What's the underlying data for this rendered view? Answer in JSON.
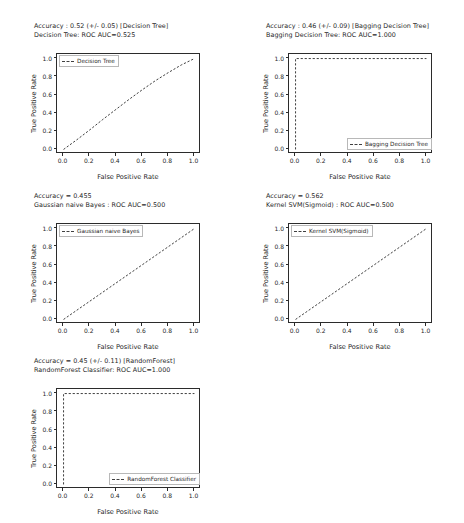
{
  "figure": {
    "background": "#ffffff",
    "line_color": "#404040",
    "line_style": "dashed",
    "axis_color": "#2b2b2b"
  },
  "chart_data": [
    {
      "type": "line",
      "title": "Accuracy : 0.52 (+/- 0.05) [Decision Tree]",
      "subtitle": "Decision Tree: ROC AUC=0.525",
      "xlabel": "False Positive Rate",
      "ylabel": "True Positive Rate",
      "xlim": [
        -0.05,
        1.05
      ],
      "ylim": [
        -0.05,
        1.05
      ],
      "xticks": [
        "0.0",
        "0.2",
        "0.4",
        "0.6",
        "0.8",
        "1.0"
      ],
      "yticks": [
        "0.0",
        "0.2",
        "0.4",
        "0.6",
        "0.8",
        "1.0"
      ],
      "grid": false,
      "legend_position": "upper left",
      "series": [
        {
          "name": "Decision Tree",
          "x": [
            0.0,
            0.1,
            0.2,
            0.3,
            0.4,
            0.5,
            0.6,
            0.7,
            0.8,
            0.9,
            1.0
          ],
          "values": [
            0.0,
            0.105,
            0.215,
            0.33,
            0.44,
            0.55,
            0.655,
            0.755,
            0.845,
            0.93,
            1.0
          ]
        }
      ]
    },
    {
      "type": "line",
      "title": "Accuracy : 0.46 (+/- 0.09) [Bagging Decision Tree]",
      "subtitle": "Bagging Decision Tree: ROC AUC=1.000",
      "xlabel": "False Positive Rate",
      "ylabel": "True Positive Rate",
      "xlim": [
        -0.05,
        1.05
      ],
      "ylim": [
        -0.05,
        1.05
      ],
      "xticks": [
        "0.0",
        "0.2",
        "0.4",
        "0.6",
        "0.8",
        "1.0"
      ],
      "yticks": [
        "0.0",
        "0.2",
        "0.4",
        "0.6",
        "0.8",
        "1.0"
      ],
      "grid": false,
      "legend_position": "lower right",
      "series": [
        {
          "name": "Bagging Decision Tree",
          "x": [
            0.0,
            0.0,
            1.0
          ],
          "values": [
            0.0,
            1.0,
            1.0
          ]
        }
      ]
    },
    {
      "type": "line",
      "title": "Accuracy = 0.455",
      "subtitle": "Gaussian naive Bayes : ROC AUC=0.500",
      "xlabel": "False Positive Rate",
      "ylabel": "True Positive Rate",
      "xlim": [
        -0.05,
        1.05
      ],
      "ylim": [
        -0.05,
        1.05
      ],
      "xticks": [
        "0.0",
        "0.2",
        "0.4",
        "0.6",
        "0.8",
        "1.0"
      ],
      "yticks": [
        "0.0",
        "0.2",
        "0.4",
        "0.6",
        "0.8",
        "1.0"
      ],
      "grid": false,
      "legend_position": "upper left",
      "series": [
        {
          "name": "Gaussian naive Bayes",
          "x": [
            0.0,
            1.0
          ],
          "values": [
            0.0,
            1.0
          ]
        }
      ]
    },
    {
      "type": "line",
      "title": "Accuracy = 0.562",
      "subtitle": "Kernel SVM(Sigmoid) : ROC AUC=0.500",
      "xlabel": "False Positive Rate",
      "ylabel": "True Positive Rate",
      "xlim": [
        -0.05,
        1.05
      ],
      "ylim": [
        -0.05,
        1.05
      ],
      "xticks": [
        "0.0",
        "0.2",
        "0.4",
        "0.6",
        "0.8",
        "1.0"
      ],
      "yticks": [
        "0.0",
        "0.2",
        "0.4",
        "0.6",
        "0.8",
        "1.0"
      ],
      "grid": false,
      "legend_position": "upper left",
      "series": [
        {
          "name": "Kernel SVM(Sigmoid)",
          "x": [
            0.0,
            1.0
          ],
          "values": [
            0.0,
            1.0
          ]
        }
      ]
    },
    {
      "type": "line",
      "title": "Accuracy = 0.45 (+/- 0.11) [RandomForest]",
      "subtitle": "RandomForest Classifier: ROC AUC=1.000",
      "xlabel": "False Positive Rate",
      "ylabel": "True Positive Rate",
      "xlim": [
        -0.05,
        1.05
      ],
      "ylim": [
        -0.05,
        1.05
      ],
      "xticks": [
        "0.0",
        "0.2",
        "0.4",
        "0.6",
        "0.8",
        "1.0"
      ],
      "yticks": [
        "0.0",
        "0.2",
        "0.4",
        "0.6",
        "0.8",
        "1.0"
      ],
      "grid": false,
      "legend_position": "lower right",
      "series": [
        {
          "name": "RandomForest Classifier",
          "x": [
            0.0,
            0.0,
            1.0
          ],
          "values": [
            0.0,
            1.0,
            1.0
          ]
        }
      ]
    }
  ]
}
